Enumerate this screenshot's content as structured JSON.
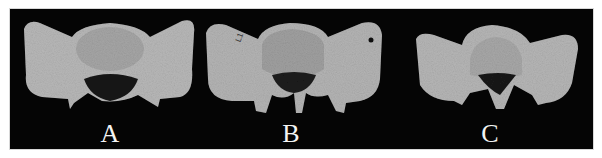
{
  "figure": {
    "panels": [
      {
        "id": "A",
        "label": "A",
        "center_x": 109
      },
      {
        "id": "B",
        "label": "B",
        "center_x": 290,
        "annotation": "L1"
      },
      {
        "id": "C",
        "label": "C",
        "center_x": 489
      }
    ],
    "colors": {
      "background": "#050505",
      "bone": "#bdbdbd",
      "bone_dark": "#8a8a8a",
      "canal": "#1a1a1a",
      "label": "#f4f4f4"
    }
  }
}
